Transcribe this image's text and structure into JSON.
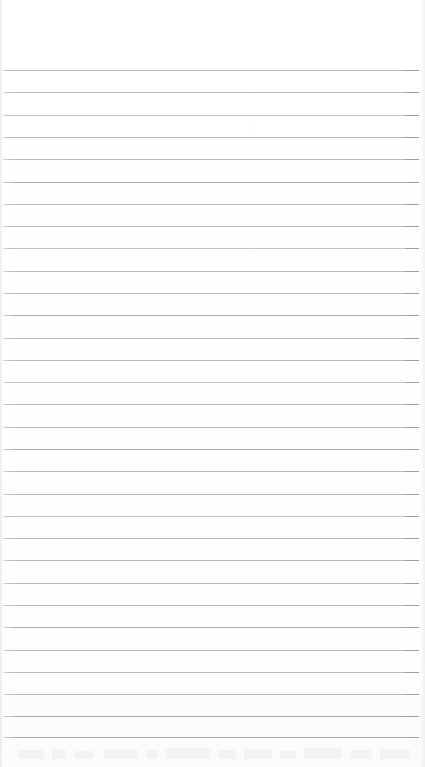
{
  "document": {
    "type": "lined-paper",
    "title": "",
    "body_text": "",
    "is_blank": "blank"
  },
  "page": {
    "width": 425,
    "height": 767,
    "background_color": "#ffffff"
  },
  "ruling": {
    "line_color": "#b6b9bd",
    "line_color_strong": "#a9acb1",
    "line_color_light": "#c3c6ca",
    "line_count": 31,
    "line_thickness": 1,
    "spacing": 22.3,
    "first_line_y": 70,
    "last_line_y": 737,
    "line_start_x": 3,
    "line_end_x": 419,
    "top_margin": 70,
    "bottom_margin": 30,
    "left_margin": 3,
    "right_margin": 6
  },
  "lines": [
    {
      "index": 1,
      "y": 70,
      "weight": "normal",
      "content": ""
    },
    {
      "index": 2,
      "y": 92,
      "weight": "normal",
      "content": ""
    },
    {
      "index": 3,
      "y": 115,
      "weight": "light",
      "content": ""
    },
    {
      "index": 4,
      "y": 137,
      "weight": "normal",
      "content": ""
    },
    {
      "index": 5,
      "y": 159,
      "weight": "normal",
      "content": ""
    },
    {
      "index": 6,
      "y": 182,
      "weight": "strong",
      "content": ""
    },
    {
      "index": 7,
      "y": 204,
      "weight": "normal",
      "content": ""
    },
    {
      "index": 8,
      "y": 226,
      "weight": "normal",
      "content": ""
    },
    {
      "index": 9,
      "y": 248,
      "weight": "light",
      "content": ""
    },
    {
      "index": 10,
      "y": 271,
      "weight": "normal",
      "content": ""
    },
    {
      "index": 11,
      "y": 293,
      "weight": "normal",
      "content": ""
    },
    {
      "index": 12,
      "y": 315,
      "weight": "strong",
      "content": ""
    },
    {
      "index": 13,
      "y": 338,
      "weight": "normal",
      "content": ""
    },
    {
      "index": 14,
      "y": 360,
      "weight": "normal",
      "content": ""
    },
    {
      "index": 15,
      "y": 382,
      "weight": "light",
      "content": ""
    },
    {
      "index": 16,
      "y": 404,
      "weight": "normal",
      "content": ""
    },
    {
      "index": 17,
      "y": 427,
      "weight": "normal",
      "content": ""
    },
    {
      "index": 18,
      "y": 449,
      "weight": "strong",
      "content": ""
    },
    {
      "index": 19,
      "y": 471,
      "weight": "normal",
      "content": ""
    },
    {
      "index": 20,
      "y": 494,
      "weight": "normal",
      "content": ""
    },
    {
      "index": 21,
      "y": 516,
      "weight": "light",
      "content": ""
    },
    {
      "index": 22,
      "y": 538,
      "weight": "normal",
      "content": ""
    },
    {
      "index": 23,
      "y": 560,
      "weight": "normal",
      "content": ""
    },
    {
      "index": 24,
      "y": 583,
      "weight": "normal",
      "content": ""
    },
    {
      "index": 25,
      "y": 605,
      "weight": "normal",
      "content": ""
    },
    {
      "index": 26,
      "y": 627,
      "weight": "strong",
      "content": ""
    },
    {
      "index": 27,
      "y": 650,
      "weight": "normal",
      "content": ""
    },
    {
      "index": 28,
      "y": 672,
      "weight": "normal",
      "content": ""
    },
    {
      "index": 29,
      "y": 694,
      "weight": "normal",
      "content": ""
    },
    {
      "index": 30,
      "y": 716,
      "weight": "strong",
      "content": ""
    },
    {
      "index": 31,
      "y": 737,
      "weight": "strong",
      "content": ""
    }
  ],
  "bottom_bleed": {
    "visible": "true",
    "top": 744,
    "height": 23,
    "color": "#f2f3f5",
    "marks": [
      {
        "x": 18,
        "y": 6,
        "w": 26,
        "h": 9
      },
      {
        "x": 52,
        "y": 5,
        "w": 14,
        "h": 10
      },
      {
        "x": 74,
        "y": 7,
        "w": 20,
        "h": 8
      },
      {
        "x": 104,
        "y": 5,
        "w": 34,
        "h": 10
      },
      {
        "x": 146,
        "y": 6,
        "w": 12,
        "h": 9
      },
      {
        "x": 166,
        "y": 4,
        "w": 44,
        "h": 11
      },
      {
        "x": 218,
        "y": 6,
        "w": 18,
        "h": 9
      },
      {
        "x": 244,
        "y": 5,
        "w": 28,
        "h": 10
      },
      {
        "x": 280,
        "y": 7,
        "w": 16,
        "h": 8
      },
      {
        "x": 304,
        "y": 4,
        "w": 38,
        "h": 11
      },
      {
        "x": 350,
        "y": 6,
        "w": 22,
        "h": 9
      },
      {
        "x": 380,
        "y": 5,
        "w": 30,
        "h": 10
      }
    ]
  }
}
